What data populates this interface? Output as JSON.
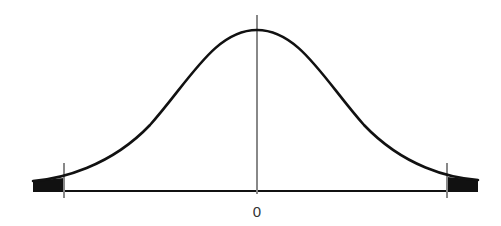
{
  "diagram": {
    "type": "normal-distribution-curve",
    "center_label": "0",
    "shaded_regions": [
      "left-tail",
      "right-tail"
    ],
    "colors": {
      "curve": "#111111",
      "axis": "#111111",
      "markers": "#888888",
      "tail_fill": "#111111"
    }
  }
}
